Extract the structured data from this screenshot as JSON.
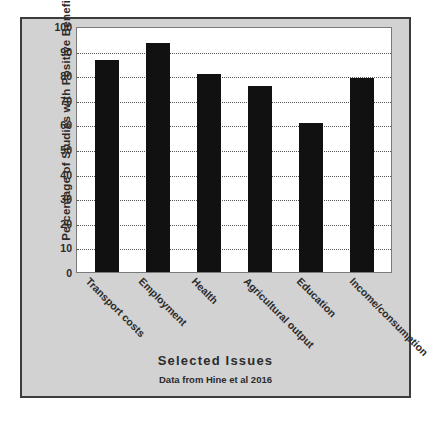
{
  "chart_data": {
    "type": "bar",
    "title": "",
    "xlabel": "Selected  Issues",
    "ylabel": "Percentage  of  Studies with  Positive  Benefits",
    "categories": [
      "Transport costs",
      "Employment",
      "Health",
      "Agricultural output",
      "Education",
      "Income/consumption"
    ],
    "values": [
      86,
      93,
      80.5,
      75.5,
      60.5,
      79
    ],
    "ylim": [
      0,
      100
    ],
    "ytick_labels": [
      "100",
      "90",
      "80",
      "70",
      "60",
      "50",
      "40",
      "30",
      "20",
      "10",
      "0"
    ],
    "ytick_values": [
      100,
      90,
      80,
      70,
      60,
      50,
      40,
      30,
      20,
      10,
      0
    ],
    "grid": true,
    "gridline_style": "dotted",
    "legend": "none",
    "annotation": "Data from Hine et al 2016",
    "bar_color": "#111111",
    "plot_background": "#ffffff",
    "figure_background": "#d2d2d2",
    "frame_color": "#3c3c3c"
  }
}
